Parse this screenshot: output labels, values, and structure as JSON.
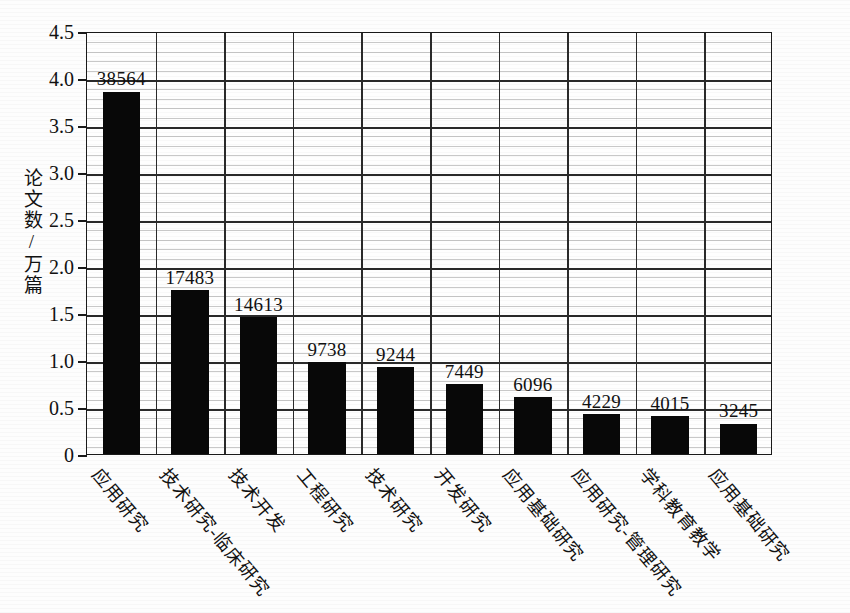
{
  "chart_data": {
    "type": "bar",
    "title": "",
    "xlabel": "",
    "ylabel": "论文数/万篇",
    "ylim": [
      0,
      4.5
    ],
    "ytick_labels": [
      "0",
      "0.5",
      "1.0",
      "1.5",
      "2.0",
      "2.5",
      "3.0",
      "3.5",
      "4.0",
      "4.5"
    ],
    "ytick_values": [
      0,
      0.5,
      1.0,
      1.5,
      2.0,
      2.5,
      3.0,
      3.5,
      4.0,
      4.5
    ],
    "minor_tick_step": 0.1,
    "grid": true,
    "legend": "none",
    "unit_note": "值标签为论文篇数；纵轴单位为万篇",
    "categories": [
      "应用研究",
      "技术研究-临床研究",
      "技术开发",
      "工程研究",
      "技术研究",
      "开发研究",
      "应用基础研究",
      "应用研究-管理研究",
      "学科教育教学",
      "应用基础研究"
    ],
    "values": [
      38564,
      17483,
      14613,
      9738,
      9244,
      7449,
      6096,
      4229,
      4015,
      3245
    ],
    "values_scaled_wan": [
      3.8564,
      1.7483,
      1.4613,
      0.9738,
      0.9244,
      0.7449,
      0.6096,
      0.4229,
      0.4015,
      0.3245
    ],
    "data_labels": [
      "38564",
      "17483",
      "14613",
      "9738",
      "9244",
      "7449",
      "6096",
      "4229",
      "4015",
      "3245"
    ],
    "bar_color": "#080808",
    "axis_color": "#1a1a1a",
    "major_grid_color": "#2a2a2a",
    "minor_grid_color": "#9a9a9a"
  }
}
